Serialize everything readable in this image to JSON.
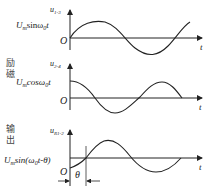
{
  "side_labels": {
    "excitation": "励磁",
    "output": "输出"
  },
  "panels": [
    {
      "axis_label": "u",
      "axis_sub": "1-3",
      "formula": "Umsinω0t",
      "formula_main": "U",
      "formula_m": "m",
      "formula_rest": "sinω",
      "formula_0": "0",
      "formula_t": "t",
      "origin": "O",
      "t_label": "t",
      "waveform": "sine"
    },
    {
      "axis_label": "u",
      "axis_sub": "2-4",
      "formula_main": "U",
      "formula_m": "m",
      "formula_rest": "cosω",
      "formula_0": "0",
      "formula_t": "t",
      "origin": "O",
      "t_label": "t",
      "waveform": "cosine"
    },
    {
      "axis_label": "u",
      "axis_sub": "R1-2",
      "formula_main": "U",
      "formula_m": "m",
      "formula_rest": "sin(ω",
      "formula_0": "0",
      "formula_t": "t-θ)",
      "origin": "O",
      "t_label": "t",
      "theta": "θ",
      "waveform": "shifted-sine"
    }
  ]
}
